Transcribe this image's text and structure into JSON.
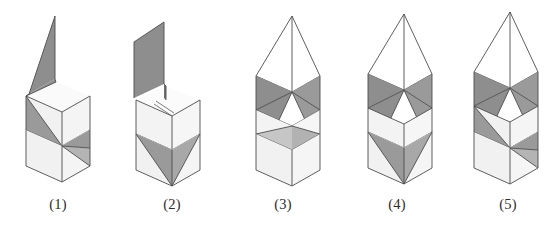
{
  "figure": {
    "title": "",
    "count": 5,
    "background_color": "#ffffff",
    "colors": {
      "edge": "#4d4d4d",
      "face_light": "#f1f1f1",
      "face_light_alt": "#e8e8e8",
      "face_mid": "#d8d8d8",
      "face_dark": "#8e8e8e",
      "face_dark_alt": "#9a9a9a",
      "face_white": "#ffffff",
      "caption_text": "#2b2b2b"
    },
    "items": [
      {
        "id": "figure-1",
        "label": "(1)",
        "label_x": 58,
        "top_feature": "single-large-slanted-fin",
        "bands": 2
      },
      {
        "id": "figure-2",
        "label": "(2)",
        "label_x": 172,
        "top_feature": "single-large-slanted-fin",
        "bands": 2
      },
      {
        "id": "figure-3",
        "label": "(3)",
        "label_x": 283,
        "top_feature": "tent-pyramid",
        "bands": 2
      },
      {
        "id": "figure-4",
        "label": "(4)",
        "label_x": 397,
        "top_feature": "tent-pyramid",
        "bands": 2
      },
      {
        "id": "figure-5",
        "label": "(5)",
        "label_x": 508,
        "top_feature": "tent-pyramid",
        "bands": 2
      }
    ]
  }
}
